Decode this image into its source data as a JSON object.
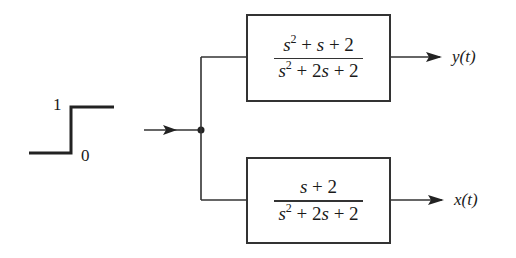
{
  "diagram": {
    "type": "block-diagram",
    "input": {
      "kind": "unit-step",
      "high_label": "1",
      "low_label": "0"
    },
    "blocks": [
      {
        "id": "top",
        "numerator": "s^2 + s + 2",
        "denominator": "s^2 + 2s + 2",
        "output_label": "y(t)"
      },
      {
        "id": "bottom",
        "numerator": "s + 2",
        "denominator": "s^2 + 2s + 2",
        "output_label": "x(t)"
      }
    ],
    "colors": {
      "line": "#333333",
      "background": "#ffffff"
    }
  }
}
